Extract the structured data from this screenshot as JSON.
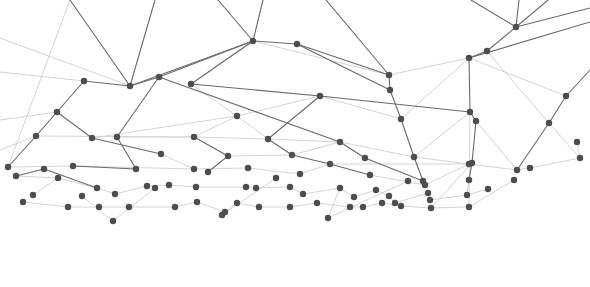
{
  "graphic": {
    "type": "network-plexus",
    "background": "#ffffff",
    "node_color": "#4d4d4f",
    "edge_dark": "#6a6a6a",
    "edge_light": "#d4d4d4",
    "width": 590,
    "height": 287
  },
  "nodes": [
    [
      70,
      0
    ],
    [
      155,
      0
    ],
    [
      218,
      0
    ],
    [
      263,
      0
    ],
    [
      326,
      0
    ],
    [
      471,
      0
    ],
    [
      519,
      0
    ],
    [
      548,
      0
    ],
    [
      590,
      8
    ],
    [
      590,
      22
    ],
    [
      0,
      38
    ],
    [
      0,
      72
    ],
    [
      0,
      120
    ],
    [
      0,
      150
    ],
    [
      253,
      41
    ],
    [
      297,
      44
    ],
    [
      84,
      81
    ],
    [
      130,
      86
    ],
    [
      159,
      77
    ],
    [
      191,
      84
    ],
    [
      389,
      75
    ],
    [
      487,
      51
    ],
    [
      469,
      58
    ],
    [
      516,
      27
    ],
    [
      390,
      90
    ],
    [
      57,
      112
    ],
    [
      237,
      116
    ],
    [
      320,
      96
    ],
    [
      566,
      96
    ],
    [
      590,
      70
    ],
    [
      36,
      136
    ],
    [
      92,
      138
    ],
    [
      117,
      137
    ],
    [
      194,
      137
    ],
    [
      268,
      139
    ],
    [
      401,
      119
    ],
    [
      470,
      112
    ],
    [
      476,
      121
    ],
    [
      549,
      123
    ],
    [
      577,
      142
    ],
    [
      161,
      154
    ],
    [
      228,
      156
    ],
    [
      292,
      155
    ],
    [
      340,
      142
    ],
    [
      365,
      158
    ],
    [
      414,
      157
    ],
    [
      469,
      164
    ],
    [
      472,
      163
    ],
    [
      517,
      170
    ],
    [
      530,
      168
    ],
    [
      580,
      158
    ],
    [
      8,
      167
    ],
    [
      16,
      176
    ],
    [
      44,
      169
    ],
    [
      73,
      166
    ],
    [
      136,
      169
    ],
    [
      194,
      169
    ],
    [
      248,
      168
    ],
    [
      208,
      172
    ],
    [
      300,
      174
    ],
    [
      330,
      164
    ],
    [
      370,
      175
    ],
    [
      423,
      181
    ],
    [
      425,
      185
    ],
    [
      469,
      180
    ],
    [
      33,
      195
    ],
    [
      58,
      178
    ],
    [
      97,
      188
    ],
    [
      82,
      196
    ],
    [
      115,
      194
    ],
    [
      147,
      186
    ],
    [
      155,
      188
    ],
    [
      169,
      185
    ],
    [
      196,
      187
    ],
    [
      246,
      187
    ],
    [
      256,
      188
    ],
    [
      276,
      178
    ],
    [
      290,
      187
    ],
    [
      303,
      194
    ],
    [
      340,
      188
    ],
    [
      354,
      197
    ],
    [
      376,
      190
    ],
    [
      389,
      196
    ],
    [
      395,
      203
    ],
    [
      408,
      181
    ],
    [
      428,
      193
    ],
    [
      430,
      200
    ],
    [
      467,
      195
    ],
    [
      488,
      189
    ],
    [
      23,
      202
    ],
    [
      68,
      207
    ],
    [
      99,
      207
    ],
    [
      129,
      207
    ],
    [
      175,
      207
    ],
    [
      197,
      202
    ],
    [
      225,
      212
    ],
    [
      237,
      203
    ],
    [
      259,
      207
    ],
    [
      290,
      207
    ],
    [
      317,
      203
    ],
    [
      350,
      207
    ],
    [
      363,
      207
    ],
    [
      382,
      203
    ],
    [
      401,
      206
    ],
    [
      431,
      208
    ],
    [
      469,
      207
    ],
    [
      514,
      180
    ],
    [
      113,
      221
    ],
    [
      222,
      215
    ],
    [
      328,
      218
    ]
  ],
  "edges_dark": [
    [
      0,
      17
    ],
    [
      1,
      17
    ],
    [
      2,
      14
    ],
    [
      3,
      14
    ],
    [
      4,
      20
    ],
    [
      5,
      23
    ],
    [
      6,
      23
    ],
    [
      7,
      23
    ],
    [
      8,
      23
    ],
    [
      9,
      22
    ],
    [
      16,
      25
    ],
    [
      25,
      30
    ],
    [
      30,
      51
    ],
    [
      16,
      17
    ],
    [
      17,
      14
    ],
    [
      17,
      18
    ],
    [
      18,
      14
    ],
    [
      19,
      14
    ],
    [
      19,
      27
    ],
    [
      14,
      15
    ],
    [
      15,
      24
    ],
    [
      15,
      20
    ],
    [
      20,
      24
    ],
    [
      24,
      35
    ],
    [
      35,
      45
    ],
    [
      45,
      62
    ],
    [
      62,
      63
    ],
    [
      18,
      32
    ],
    [
      18,
      43
    ],
    [
      27,
      34
    ],
    [
      27,
      36
    ],
    [
      22,
      36
    ],
    [
      22,
      21
    ],
    [
      21,
      23
    ],
    [
      36,
      37
    ],
    [
      37,
      47
    ],
    [
      47,
      64
    ],
    [
      28,
      38
    ],
    [
      38,
      48
    ],
    [
      29,
      28
    ],
    [
      25,
      31
    ],
    [
      31,
      40
    ],
    [
      54,
      55
    ],
    [
      55,
      32
    ],
    [
      33,
      41
    ],
    [
      41,
      58
    ],
    [
      34,
      42
    ],
    [
      42,
      60
    ],
    [
      60,
      61
    ],
    [
      43,
      44
    ],
    [
      44,
      62
    ],
    [
      52,
      53
    ],
    [
      53,
      67
    ]
  ],
  "edges_light": [
    [
      10,
      17
    ],
    [
      11,
      16
    ],
    [
      12,
      25
    ],
    [
      13,
      30
    ],
    [
      14,
      20
    ],
    [
      14,
      19
    ],
    [
      19,
      26
    ],
    [
      26,
      27
    ],
    [
      26,
      33
    ],
    [
      26,
      34
    ],
    [
      27,
      35
    ],
    [
      35,
      22
    ],
    [
      20,
      22
    ],
    [
      21,
      38
    ],
    [
      22,
      28
    ],
    [
      30,
      33
    ],
    [
      31,
      26
    ],
    [
      32,
      33
    ],
    [
      33,
      34
    ],
    [
      34,
      43
    ],
    [
      36,
      45
    ],
    [
      37,
      48
    ],
    [
      38,
      50
    ],
    [
      39,
      50
    ],
    [
      40,
      56
    ],
    [
      41,
      42
    ],
    [
      42,
      43
    ],
    [
      43,
      45
    ],
    [
      45,
      46
    ],
    [
      46,
      48
    ],
    [
      48,
      49
    ],
    [
      49,
      50
    ],
    [
      51,
      54
    ],
    [
      52,
      66
    ],
    [
      54,
      56
    ],
    [
      56,
      57
    ],
    [
      57,
      59
    ],
    [
      59,
      60
    ],
    [
      60,
      46
    ],
    [
      61,
      63
    ],
    [
      63,
      46
    ],
    [
      64,
      87
    ],
    [
      65,
      66
    ],
    [
      66,
      67
    ],
    [
      67,
      69
    ],
    [
      69,
      70
    ],
    [
      70,
      72
    ],
    [
      72,
      73
    ],
    [
      73,
      74
    ],
    [
      74,
      75
    ],
    [
      75,
      77
    ],
    [
      77,
      78
    ],
    [
      78,
      79
    ],
    [
      79,
      80
    ],
    [
      80,
      81
    ],
    [
      81,
      82
    ],
    [
      82,
      83
    ],
    [
      83,
      85
    ],
    [
      85,
      86
    ],
    [
      86,
      87
    ],
    [
      87,
      88
    ],
    [
      89,
      90
    ],
    [
      90,
      91
    ],
    [
      91,
      92
    ],
    [
      92,
      93
    ],
    [
      93,
      94
    ],
    [
      94,
      95
    ],
    [
      95,
      96
    ],
    [
      96,
      97
    ],
    [
      97,
      98
    ],
    [
      98,
      99
    ],
    [
      99,
      100
    ],
    [
      100,
      101
    ],
    [
      101,
      102
    ],
    [
      102,
      103
    ],
    [
      103,
      104
    ],
    [
      104,
      105
    ],
    [
      105,
      106
    ],
    [
      68,
      107
    ],
    [
      107,
      71
    ],
    [
      95,
      108
    ],
    [
      108,
      76
    ],
    [
      79,
      109
    ],
    [
      109,
      84
    ],
    [
      0,
      51
    ],
    [
      36,
      105
    ],
    [
      47,
      104
    ]
  ]
}
